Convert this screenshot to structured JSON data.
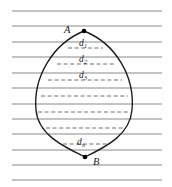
{
  "figure": {
    "type": "geometry-diagram",
    "background_color": "#ffffff",
    "ruled_line_color": "#8a8a8a",
    "outline_color": "#1a1a1a",
    "dashed_chord_color": "#6e6e6e",
    "point_color": "#000000",
    "points": [
      {
        "id": "A",
        "label": "A",
        "x": 84,
        "y": 31,
        "label_x": 64,
        "label_y": 25
      },
      {
        "id": "B",
        "label": "B",
        "x": 85,
        "y": 157,
        "label_x": 93,
        "label_y": 157
      }
    ],
    "ruled_lines": {
      "count": 12,
      "x_start": 12,
      "x_end": 162,
      "spacing": 15.4,
      "y_values": [
        11,
        26,
        42,
        57,
        73,
        88,
        104,
        119,
        134,
        150,
        165,
        180
      ]
    },
    "chords": [
      {
        "label": "d",
        "sub": "1",
        "y": 48,
        "x1": 68,
        "x2": 103,
        "label_x": 79,
        "label_y": 39
      },
      {
        "label": "d",
        "sub": "2",
        "y": 64,
        "x1": 57,
        "x2": 114,
        "label_x": 79,
        "label_y": 55
      },
      {
        "label": "d",
        "sub": "3",
        "y": 80,
        "x1": 48,
        "x2": 122,
        "label_x": 79,
        "label_y": 71
      },
      {
        "label": "",
        "sub": "",
        "y": 96,
        "x1": 41,
        "x2": 128,
        "label_x": 0,
        "label_y": 0
      },
      {
        "label": "",
        "sub": "",
        "y": 112,
        "x1": 38,
        "x2": 130,
        "label_x": 0,
        "label_y": 0
      },
      {
        "label": "",
        "sub": "",
        "y": 128,
        "x1": 46,
        "x2": 124,
        "label_x": 0,
        "label_y": 0
      },
      {
        "label": "d",
        "sub": "n",
        "y": 144,
        "x1": 63,
        "x2": 108,
        "label_x": 77,
        "label_y": 138
      }
    ]
  }
}
